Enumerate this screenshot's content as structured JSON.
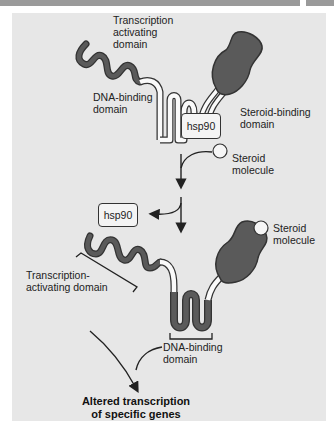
{
  "figure": {
    "labels": {
      "transcription_activating_domain_top": "Transcription\nactivating\ndomain",
      "dna_binding_domain_top": "DNA-binding\ndomain",
      "steroid_binding_domain": "Steroid-binding\ndomain",
      "hsp90_bound": "hsp90",
      "steroid_molecule_1": "Steroid\nmolecule",
      "hsp90_released": "hsp90",
      "steroid_molecule_2": "Steroid\nmolecule",
      "transcription_activating_domain_bottom": "Transcription-\nactivating domain",
      "dna_binding_domain_bottom": "DNA-binding\ndomain",
      "outcome": "Altered transcription\nof specific genes"
    },
    "colors": {
      "panel_background": "#e7e7e7",
      "domain_fill": "#5a5a5a",
      "strand_outline": "#333333",
      "header_bar": "#9a9a9a"
    }
  }
}
